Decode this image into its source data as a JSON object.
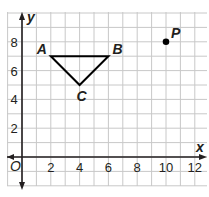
{
  "diagram": {
    "type": "coordinate-plane",
    "axes": {
      "x_label": "x",
      "y_label": "y",
      "origin_label": "O",
      "x_ticks": [
        "2",
        "4",
        "6",
        "8",
        "10",
        "12"
      ],
      "y_ticks": [
        "2",
        "4",
        "6",
        "8"
      ]
    },
    "triangle": {
      "vertices": [
        {
          "label": "A",
          "x": 2,
          "y": 7
        },
        {
          "label": "B",
          "x": 6,
          "y": 7
        },
        {
          "label": "C",
          "x": 4,
          "y": 5
        }
      ]
    },
    "point": {
      "label": "P",
      "x": 10,
      "y": 8
    },
    "colors": {
      "grid": "#c8c8c8",
      "axis": "#231f20",
      "shape": "#000000"
    }
  }
}
